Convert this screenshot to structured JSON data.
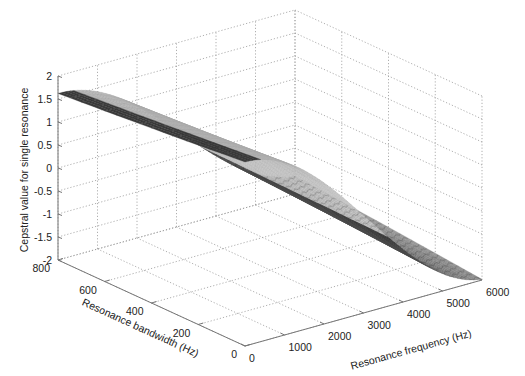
{
  "chart_data": {
    "type": "surface3d",
    "title": "",
    "xlabel": "Resonance frequency (Hz)",
    "ylabel": "Resonance bandwidth (Hz)",
    "zlabel": "Cepstral value for single resonance",
    "x_ticks": [
      "0",
      "1000",
      "2000",
      "3000",
      "4000",
      "5000",
      "6000"
    ],
    "y_ticks": [
      "0",
      "200",
      "400",
      "600",
      "800"
    ],
    "z_ticks": [
      "-2",
      "-1.5",
      "-1",
      "-0.5",
      "0",
      "0.5",
      "1",
      "1.5",
      "2"
    ],
    "xlim": [
      0,
      6000
    ],
    "ylim": [
      0,
      800
    ],
    "zlim": [
      -2,
      2
    ],
    "grid": true,
    "colormap": "gray",
    "sample_points": [
      {
        "frequency": 0,
        "bandwidth": 800,
        "value": 1.45
      },
      {
        "frequency": 0,
        "bandwidth": 0,
        "value": 2.0
      },
      {
        "frequency": 2000,
        "bandwidth": 0,
        "value": 1.0
      },
      {
        "frequency": 4000,
        "bandwidth": 0,
        "value": -1.0
      },
      {
        "frequency": 5000,
        "bandwidth": 0,
        "value": -1.7
      },
      {
        "frequency": 6000,
        "bandwidth": 800,
        "value": -0.3
      }
    ]
  },
  "labels": {
    "xlabel": "Resonance frequency (Hz)",
    "ylabel": "Resonance bandwidth (Hz)",
    "zlabel": "Cepstral value for single resonance"
  }
}
